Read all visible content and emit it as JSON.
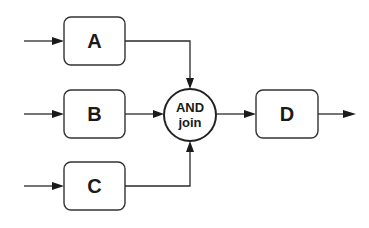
{
  "diagram": {
    "type": "workflow-and-join",
    "nodes": {
      "a": {
        "label": "A"
      },
      "b": {
        "label": "B"
      },
      "c": {
        "label": "C"
      },
      "join": {
        "line1": "AND",
        "line2": "join"
      },
      "d": {
        "label": "D"
      }
    },
    "edges": [
      {
        "from": "input",
        "to": "A"
      },
      {
        "from": "input",
        "to": "B"
      },
      {
        "from": "input",
        "to": "C"
      },
      {
        "from": "A",
        "to": "AND join"
      },
      {
        "from": "B",
        "to": "AND join"
      },
      {
        "from": "C",
        "to": "AND join"
      },
      {
        "from": "AND join",
        "to": "D"
      },
      {
        "from": "D",
        "to": "output"
      }
    ]
  }
}
